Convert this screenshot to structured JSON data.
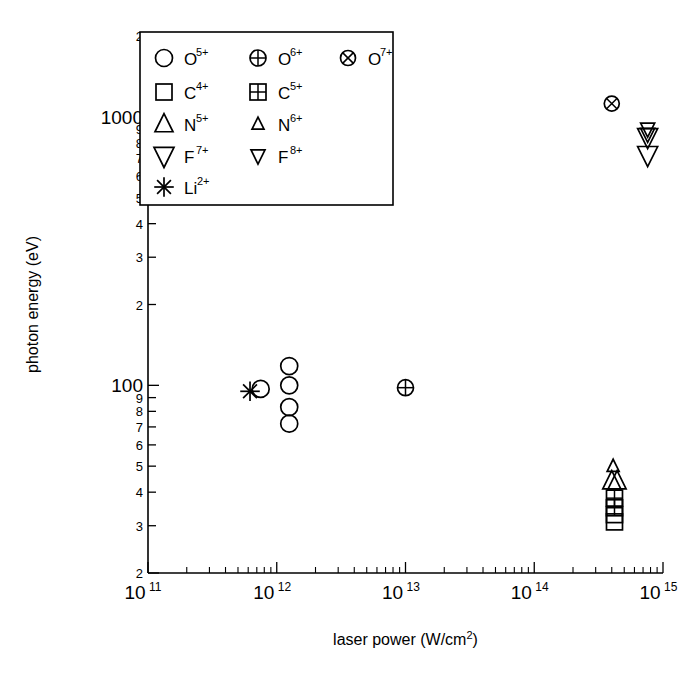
{
  "chart_data": {
    "type": "scatter",
    "title": "",
    "xlabel": "laser power (W/cm²)",
    "ylabel": "photon energy (eV)",
    "xscale": "log",
    "yscale": "log",
    "xlim": [
      100000000000.0,
      1000000000000000.0
    ],
    "ylim": [
      20,
      2000
    ],
    "grid": false,
    "legend_position": "upper-left-inset",
    "x_tick_labels": [
      "10",
      "10",
      "10",
      "10",
      "10"
    ],
    "x_tick_exponents": [
      "11",
      "12",
      "13",
      "14",
      "15"
    ],
    "x_tick_values": [
      100000000000.0,
      1000000000000.0,
      10000000000000.0,
      100000000000000.0,
      1000000000000000.0
    ],
    "y_tick_labels": [
      "2",
      "1000",
      "9",
      "8",
      "7",
      "6",
      "5",
      "4",
      "3",
      "2",
      "100",
      "9",
      "8",
      "7",
      "6",
      "5",
      "4",
      "3",
      "2"
    ],
    "y_tick_values": [
      2000,
      1000,
      900,
      800,
      700,
      600,
      500,
      400,
      300,
      200,
      100,
      90,
      80,
      70,
      60,
      50,
      40,
      30,
      20
    ],
    "legend": [
      {
        "marker": "circle-open",
        "label": "O",
        "charge": "5+"
      },
      {
        "marker": "circle-plus",
        "label": "O",
        "charge": "6+"
      },
      {
        "marker": "circle-cross",
        "label": "O",
        "charge": "7+"
      },
      {
        "marker": "square-open",
        "label": "C",
        "charge": "4+"
      },
      {
        "marker": "square-grid",
        "label": "C",
        "charge": "5+"
      },
      {
        "marker": "triangle-up-large",
        "label": "N",
        "charge": "5+"
      },
      {
        "marker": "triangle-up-small",
        "label": "N",
        "charge": "6+"
      },
      {
        "marker": "triangle-down-large",
        "label": "F",
        "charge": "7+"
      },
      {
        "marker": "triangle-down-small",
        "label": "F",
        "charge": "8+"
      },
      {
        "marker": "asterisk",
        "label": "Li",
        "charge": "2+"
      }
    ],
    "series": [
      {
        "name": "O 5+",
        "marker": "circle-open",
        "points": [
          {
            "x": 750000000000.0,
            "y": 97
          },
          {
            "x": 1250000000000.0,
            "y": 118
          },
          {
            "x": 1250000000000.0,
            "y": 100
          },
          {
            "x": 1250000000000.0,
            "y": 83
          },
          {
            "x": 1250000000000.0,
            "y": 72
          }
        ]
      },
      {
        "name": "O 6+",
        "marker": "circle-plus",
        "points": [
          {
            "x": 10000000000000.0,
            "y": 98
          }
        ]
      },
      {
        "name": "O 7+",
        "marker": "circle-cross",
        "points": [
          {
            "x": 400000000000000.0,
            "y": 1120
          }
        ]
      },
      {
        "name": "C 4+",
        "marker": "square-open",
        "points": [
          {
            "x": 420000000000000.0,
            "y": 33
          },
          {
            "x": 420000000000000.0,
            "y": 31
          }
        ]
      },
      {
        "name": "C 5+",
        "marker": "square-grid",
        "points": [
          {
            "x": 420000000000000.0,
            "y": 38
          },
          {
            "x": 420000000000000.0,
            "y": 35
          }
        ]
      },
      {
        "name": "N 5+",
        "marker": "triangle-up-large",
        "points": [
          {
            "x": 400000000000000.0,
            "y": 44
          },
          {
            "x": 440000000000000.0,
            "y": 44
          }
        ]
      },
      {
        "name": "N 6+",
        "marker": "triangle-up-small",
        "points": [
          {
            "x": 410000000000000.0,
            "y": 50
          }
        ]
      },
      {
        "name": "F 7+",
        "marker": "triangle-down-large",
        "points": [
          {
            "x": 760000000000000.0,
            "y": 840
          },
          {
            "x": 760000000000000.0,
            "y": 720
          }
        ]
      },
      {
        "name": "F 8+",
        "marker": "triangle-down-small",
        "points": [
          {
            "x": 760000000000000.0,
            "y": 900
          },
          {
            "x": 760000000000000.0,
            "y": 860
          }
        ]
      },
      {
        "name": "Li 2+",
        "marker": "asterisk",
        "points": [
          {
            "x": 620000000000.0,
            "y": 95
          }
        ]
      }
    ]
  }
}
